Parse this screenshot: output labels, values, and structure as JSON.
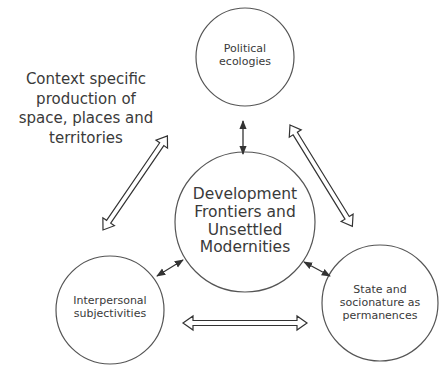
{
  "diagram": {
    "context_note": {
      "lines": [
        "Context specific",
        "production of",
        "space, places and",
        "territories"
      ]
    },
    "nodes": {
      "top": {
        "lines": [
          "Political",
          "ecologies"
        ]
      },
      "center": {
        "lines": [
          "Development",
          "Frontiers and",
          "Unsettled",
          "Modernities"
        ]
      },
      "bottom_left": {
        "lines": [
          "Interpersonal",
          "subjectivities"
        ]
      },
      "bottom_right": {
        "lines": [
          "State and",
          "socionature as",
          "permanences"
        ]
      }
    },
    "connections": [
      {
        "from": "top",
        "to": "center",
        "style": "thin-double-arrow"
      },
      {
        "from": "bottom_left",
        "to": "center",
        "style": "thin-double-arrow"
      },
      {
        "from": "bottom_right",
        "to": "center",
        "style": "thin-double-arrow"
      },
      {
        "from": "top",
        "to": "bottom_left",
        "style": "hollow-double-arrow"
      },
      {
        "from": "top",
        "to": "bottom_right",
        "style": "hollow-double-arrow"
      },
      {
        "from": "bottom_left",
        "to": "bottom_right",
        "style": "hollow-double-arrow"
      }
    ],
    "colors": {
      "stroke": "#444444",
      "text": "#3a3a3a",
      "background": "#ffffff"
    }
  }
}
